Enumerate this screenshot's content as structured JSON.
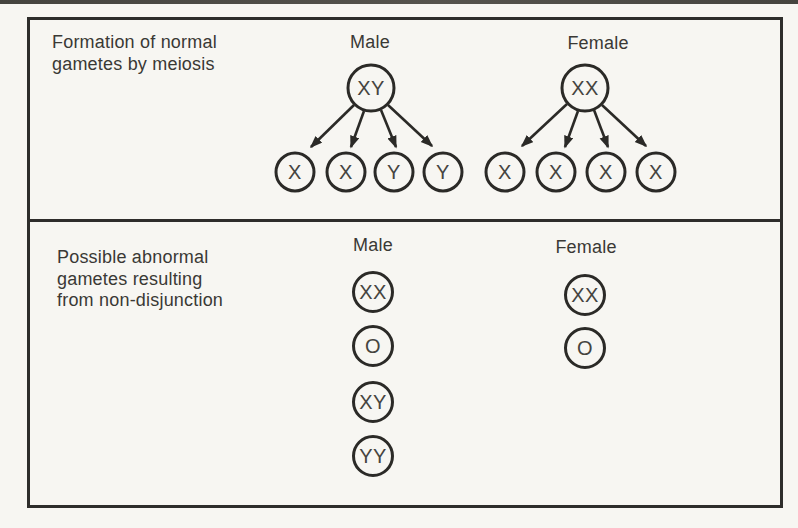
{
  "normal_section": {
    "caption": "Formation of normal\ngametes by meiosis",
    "male": {
      "label": "Male",
      "parent_cell": "XY",
      "gametes": [
        "X",
        "X",
        "Y",
        "Y"
      ]
    },
    "female": {
      "label": "Female",
      "parent_cell": "XX",
      "gametes": [
        "X",
        "X",
        "X",
        "X"
      ]
    }
  },
  "abnormal_section": {
    "caption": "Possible abnormal\ngametes resulting\nfrom non-disjunction",
    "male": {
      "label": "Male",
      "gametes": [
        "XX",
        "O",
        "XY",
        "YY"
      ]
    },
    "female": {
      "label": "Female",
      "gametes": [
        "XX",
        "O"
      ]
    }
  },
  "colors": {
    "line": "#2e2d2b",
    "text": "#3a3935",
    "paper": "#f7f6f2"
  }
}
